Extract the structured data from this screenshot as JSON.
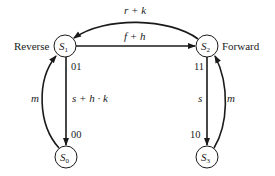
{
  "diagram": {
    "type": "state-transition",
    "nodes": [
      {
        "id": "S1",
        "label": "S",
        "subscript": "1",
        "code": "01",
        "side_label": "Reverse"
      },
      {
        "id": "S2",
        "label": "S",
        "subscript": "2",
        "code": "11",
        "side_label": "Forward"
      },
      {
        "id": "S0",
        "label": "S",
        "subscript": "0",
        "code": "00"
      },
      {
        "id": "S3",
        "label": "S",
        "subscript": "3",
        "code": "10"
      }
    ],
    "edges": [
      {
        "from": "S2",
        "to": "S1",
        "label": "r + k"
      },
      {
        "from": "S1",
        "to": "S2",
        "label": "f + h"
      },
      {
        "from": "S1",
        "to": "S0",
        "label": "s + h · k"
      },
      {
        "from": "S0",
        "to": "S1",
        "label": "m"
      },
      {
        "from": "S2",
        "to": "S3",
        "label": "s"
      },
      {
        "from": "S3",
        "to": "S2",
        "label": "m"
      }
    ],
    "colors": {
      "stroke": "#1a1a1a",
      "text": "#222222",
      "background": "#ffffff"
    }
  }
}
